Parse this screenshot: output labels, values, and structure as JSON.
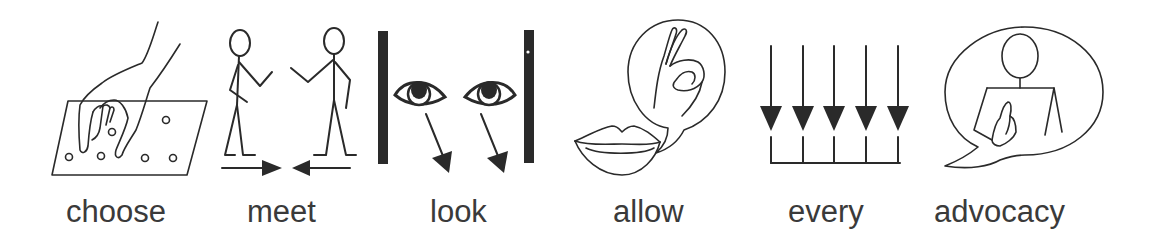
{
  "symbols": [
    {
      "label": "choose",
      "icon": "hand-picking-from-board-icon"
    },
    {
      "label": "meet",
      "icon": "two-people-meeting-icon"
    },
    {
      "label": "look",
      "icon": "eyes-looking-down-icon"
    },
    {
      "label": "allow",
      "icon": "lips-with-ok-sign-icon"
    },
    {
      "label": "every",
      "icon": "five-arrows-converging-icon"
    },
    {
      "label": "advocacy",
      "icon": "person-speech-bubble-icon"
    }
  ],
  "colors": {
    "background": "#ffffff",
    "ink": "#2a2a2a",
    "label_text": "#3a3a3a"
  }
}
